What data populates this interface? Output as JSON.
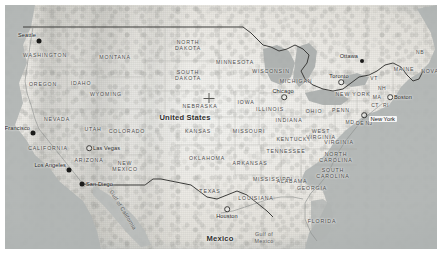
{
  "map": {
    "title": "United States terrain map",
    "country_labels": [
      {
        "name": "United States",
        "x": 180,
        "y": 112
      },
      {
        "name": "Mexico",
        "x": 215,
        "y": 233
      }
    ],
    "state_labels": [
      {
        "name": "WASHINGTON",
        "x": 40,
        "y": 50
      },
      {
        "name": "OREGON",
        "x": 38,
        "y": 79
      },
      {
        "name": "IDAHO",
        "x": 76,
        "y": 78
      },
      {
        "name": "MONTANA",
        "x": 110,
        "y": 52
      },
      {
        "name": "WYOMING",
        "x": 101,
        "y": 89
      },
      {
        "name": "NEVADA",
        "x": 52,
        "y": 114
      },
      {
        "name": "UTAH",
        "x": 88,
        "y": 124
      },
      {
        "name": "CALIFORNIA",
        "x": 43,
        "y": 143
      },
      {
        "name": "ARIZONA",
        "x": 84,
        "y": 155
      },
      {
        "name": "COLORADO",
        "x": 122,
        "y": 126
      },
      {
        "name": "NEW MEXICO",
        "x": 120,
        "y": 161
      },
      {
        "name": "NORTH DAKOTA",
        "x": 183,
        "y": 40
      },
      {
        "name": "SOUTH DAKOTA",
        "x": 183,
        "y": 70
      },
      {
        "name": "NEBRASKA",
        "x": 195,
        "y": 101
      },
      {
        "name": "KANSAS",
        "x": 193,
        "y": 126
      },
      {
        "name": "OKLAHOMA",
        "x": 202,
        "y": 153
      },
      {
        "name": "TEXAS",
        "x": 205,
        "y": 186
      },
      {
        "name": "MINNESOTA",
        "x": 230,
        "y": 57
      },
      {
        "name": "IOWA",
        "x": 241,
        "y": 97
      },
      {
        "name": "MISSOURI",
        "x": 244,
        "y": 126
      },
      {
        "name": "ARKANSAS",
        "x": 245,
        "y": 158
      },
      {
        "name": "LOUISIANA",
        "x": 251,
        "y": 193
      },
      {
        "name": "WISCONSIN",
        "x": 266,
        "y": 66
      },
      {
        "name": "ILLINOIS",
        "x": 265,
        "y": 104
      },
      {
        "name": "INDIANA",
        "x": 284,
        "y": 115
      },
      {
        "name": "MICHIGAN",
        "x": 291,
        "y": 76
      },
      {
        "name": "MISSISSIPPI",
        "x": 268,
        "y": 174
      },
      {
        "name": "ALABAMA",
        "x": 287,
        "y": 176
      },
      {
        "name": "TENNESSEE",
        "x": 281,
        "y": 146
      },
      {
        "name": "KENTUCKY",
        "x": 289,
        "y": 134
      },
      {
        "name": "OHIO",
        "x": 309,
        "y": 106
      },
      {
        "name": "PENN",
        "x": 336,
        "y": 105
      },
      {
        "name": "WEST VIRGINIA",
        "x": 316,
        "y": 129
      },
      {
        "name": "VIRGINIA",
        "x": 334,
        "y": 137
      },
      {
        "name": "NORTH CAROLINA",
        "x": 331,
        "y": 152
      },
      {
        "name": "SOUTH CAROLINA",
        "x": 328,
        "y": 168
      },
      {
        "name": "GEORGIA",
        "x": 307,
        "y": 183
      },
      {
        "name": "FLORIDA",
        "x": 317,
        "y": 216
      },
      {
        "name": "NEW YORK",
        "x": 348,
        "y": 89
      },
      {
        "name": "MAINE",
        "x": 399,
        "y": 64
      },
      {
        "name": "VT",
        "x": 369,
        "y": 73
      },
      {
        "name": "NH",
        "x": 377,
        "y": 83
      },
      {
        "name": "MA",
        "x": 372,
        "y": 92
      },
      {
        "name": "CT",
        "x": 370,
        "y": 100
      },
      {
        "name": "RI",
        "x": 381,
        "y": 100
      },
      {
        "name": "MD",
        "x": 345,
        "y": 117
      },
      {
        "name": "DE",
        "x": 355,
        "y": 118
      },
      {
        "name": "NJ",
        "x": 364,
        "y": 118
      },
      {
        "name": "NB",
        "x": 415,
        "y": 47
      },
      {
        "name": "NOVA",
        "x": 425,
        "y": 66
      }
    ],
    "water_labels": [
      {
        "name": "Gulf of\nMexico",
        "x": 259,
        "y": 233,
        "rotated": false
      },
      {
        "name": "Gulf of California",
        "x": 118,
        "y": 205,
        "rotated": true
      }
    ],
    "cities": [
      {
        "name": "Seattle",
        "x": 34,
        "y": 36,
        "marker": "dot-big",
        "align": "right",
        "dx": -3,
        "dy": -6
      },
      {
        "name": "San Francisco",
        "x": 28,
        "y": 128,
        "marker": "dot-big",
        "align": "right",
        "dx": -3,
        "dy": -5
      },
      {
        "name": "Los Angeles",
        "x": 64,
        "y": 165,
        "marker": "dot-big",
        "align": "right",
        "dx": -3,
        "dy": -5
      },
      {
        "name": "San Diego",
        "x": 77,
        "y": 179,
        "marker": "dot-big",
        "align": "left",
        "dx": 4,
        "dy": 0
      },
      {
        "name": "Las Vegas",
        "x": 84,
        "y": 143,
        "marker": "ring",
        "align": "left",
        "dx": 4,
        "dy": 0
      },
      {
        "name": "Houston",
        "x": 222,
        "y": 204,
        "marker": "ring",
        "align": "center",
        "dx": 0,
        "dy": 7
      },
      {
        "name": "Chicago",
        "x": 279,
        "y": 92,
        "marker": "ring",
        "align": "center",
        "dx": -1,
        "dy": -6
      },
      {
        "name": "Toronto",
        "x": 336,
        "y": 77,
        "marker": "ring",
        "align": "center",
        "dx": -2,
        "dy": -6
      },
      {
        "name": "Ottawa",
        "x": 357,
        "y": 56,
        "marker": "dot-mid",
        "align": "right",
        "dx": -4,
        "dy": -5
      },
      {
        "name": "Boston",
        "x": 385,
        "y": 92,
        "marker": "ring",
        "align": "left",
        "dx": 4,
        "dy": 0
      },
      {
        "name": "New York",
        "x": 359,
        "y": 110,
        "marker": "ring",
        "align": "box",
        "dx": 5,
        "dy": 4
      }
    ],
    "markers": [
      {
        "name": "center-crosshair",
        "x": 204,
        "y": 93
      }
    ],
    "colors": {
      "ocean": "#b5b9b8",
      "land": "#eceae5",
      "border": "#3c3c3a",
      "label": "#4a4a48",
      "city_label": "#1d1d1c",
      "page_background": "#ffffff"
    }
  }
}
